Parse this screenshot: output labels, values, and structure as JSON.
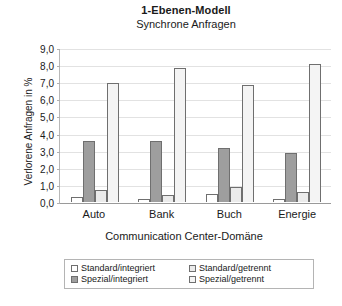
{
  "chart_data": {
    "type": "bar",
    "title": "1-Ebenen-Modell",
    "subtitle": "Synchrone Anfragen",
    "xlabel": "Communication Center-Domäne",
    "ylabel": "Verlorene Anfragen in %",
    "categories": [
      "Auto",
      "Bank",
      "Buch",
      "Energie"
    ],
    "ylim": [
      0.0,
      9.0
    ],
    "ytick_step": 1.0,
    "ytick_labels": [
      "9,0",
      "8,0",
      "7,0",
      "6,0",
      "5,0",
      "4,0",
      "3,0",
      "2,0",
      "1,0",
      "0,0"
    ],
    "ytick_values": [
      9.0,
      8.0,
      7.0,
      6.0,
      5.0,
      4.0,
      3.0,
      2.0,
      1.0,
      0.0
    ],
    "grid": true,
    "legend_position": "bottom",
    "series": [
      {
        "name": "Standard/integriert",
        "color": "#ffffff",
        "values": [
          0.3,
          0.15,
          0.5,
          0.2
        ]
      },
      {
        "name": "Spezial/integriert",
        "color": "#9e9e9e",
        "values": [
          0.7,
          0.4,
          0.9,
          0.6
        ]
      },
      {
        "name": "Standard/getrennt",
        "color": "#ebebeb",
        "values": [
          3.6,
          3.6,
          3.2,
          2.9
        ]
      },
      {
        "name": "Spezial/getrennt",
        "color": "#f4f4f4",
        "values": [
          7.0,
          7.9,
          6.9,
          8.1
        ]
      }
    ],
    "bar_order": [
      "Standard/integriert",
      "Standard/getrennt",
      "Spezial/integriert",
      "Spezial/getrennt"
    ],
    "legend_entries": [
      {
        "label": "Standard/integriert",
        "swatch": "s0"
      },
      {
        "label": "Standard/getrennt",
        "swatch": "s1"
      },
      {
        "label": "Spezial/integriert",
        "swatch": "s2"
      },
      {
        "label": "Spezial/getrennt",
        "swatch": "s3"
      }
    ]
  }
}
